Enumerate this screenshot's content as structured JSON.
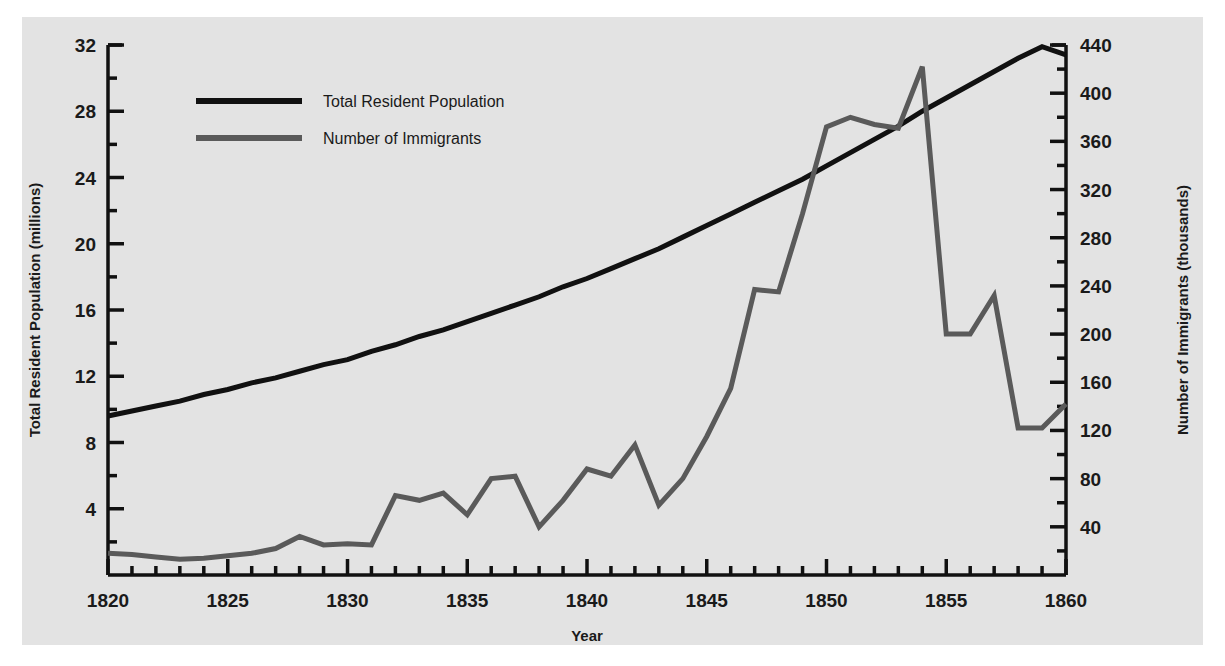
{
  "chart_data": {
    "type": "line",
    "title": "",
    "xlabel": "Year",
    "ylabel": "Total Resident Population (millions)",
    "y2label": "Number of Immigrants (thousands)",
    "grid": false,
    "legend_position": "top-left",
    "xlim": [
      1820,
      1860
    ],
    "xticks": [
      1820,
      1825,
      1830,
      1835,
      1840,
      1845,
      1850,
      1855,
      1860
    ],
    "xtick_labels": [
      "1820",
      "1825",
      "1830",
      "1835",
      "1840",
      "1845",
      "1850",
      "1855",
      "1860"
    ],
    "x_minor_tick_step": 1,
    "ylim": [
      0,
      32
    ],
    "yticks": [
      4,
      8,
      12,
      16,
      20,
      24,
      28,
      32
    ],
    "ytick_labels": [
      "4",
      "8",
      "12",
      "16",
      "20",
      "24",
      "28",
      "32"
    ],
    "y_minor_tick_step": 2,
    "y2lim": [
      0,
      440
    ],
    "y2ticks": [
      40,
      80,
      120,
      160,
      200,
      240,
      280,
      320,
      360,
      400,
      440
    ],
    "y2tick_labels": [
      "40",
      "80",
      "120",
      "160",
      "200",
      "240",
      "280",
      "320",
      "360",
      "400",
      "440"
    ],
    "y2_minor_tick_step": 20,
    "x": [
      1820,
      1821,
      1822,
      1823,
      1824,
      1825,
      1826,
      1827,
      1828,
      1829,
      1830,
      1831,
      1832,
      1833,
      1834,
      1835,
      1836,
      1837,
      1838,
      1839,
      1840,
      1841,
      1842,
      1843,
      1844,
      1845,
      1846,
      1847,
      1848,
      1849,
      1850,
      1851,
      1852,
      1853,
      1854,
      1855,
      1856,
      1857,
      1858,
      1859,
      1860
    ],
    "series": [
      {
        "name": "Total Resident Population",
        "axis": "left",
        "units": "millions",
        "color": "#111111",
        "linewidth": 5,
        "values": [
          9.6,
          9.9,
          10.2,
          10.5,
          10.9,
          11.2,
          11.6,
          11.9,
          12.3,
          12.7,
          13.0,
          13.5,
          13.9,
          14.4,
          14.8,
          15.3,
          15.8,
          16.3,
          16.8,
          17.4,
          17.9,
          18.5,
          19.1,
          19.7,
          20.4,
          21.1,
          21.8,
          22.5,
          23.2,
          23.9,
          24.7,
          25.5,
          26.3,
          27.1,
          28.0,
          28.8,
          29.6,
          30.4,
          31.2,
          31.9,
          31.4
        ],
        "values_note": "smooth exponential growth curve from 9.6M (1820) to 31.4M (1860)"
      },
      {
        "name": "Number of Immigrants",
        "axis": "right",
        "units": "thousands",
        "color": "#5a5a5a",
        "linewidth": 5,
        "values": [
          18,
          17,
          15,
          13,
          14,
          16,
          18,
          22,
          32,
          25,
          26,
          25,
          66,
          62,
          68,
          50,
          80,
          82,
          40,
          62,
          88,
          82,
          108,
          58,
          80,
          115,
          155,
          237,
          235,
          300,
          372,
          380,
          374,
          371,
          422,
          200,
          200,
          232,
          122,
          122,
          142
        ]
      }
    ],
    "annotations": []
  },
  "legend": {
    "items": [
      {
        "label": "Total Resident Population",
        "color": "#111111"
      },
      {
        "label": "Number of Immigrants",
        "color": "#5a5a5a"
      }
    ]
  },
  "axes": {
    "x_title": "Year",
    "y_left_title": "Total Resident Population (millions)",
    "y_right_title": "Number of Immigrants (thousands)"
  },
  "colors": {
    "background": "#e3e3e3",
    "page": "#ffffff",
    "axis": "#111111",
    "population_line": "#111111",
    "immigrant_line": "#5a5a5a"
  }
}
